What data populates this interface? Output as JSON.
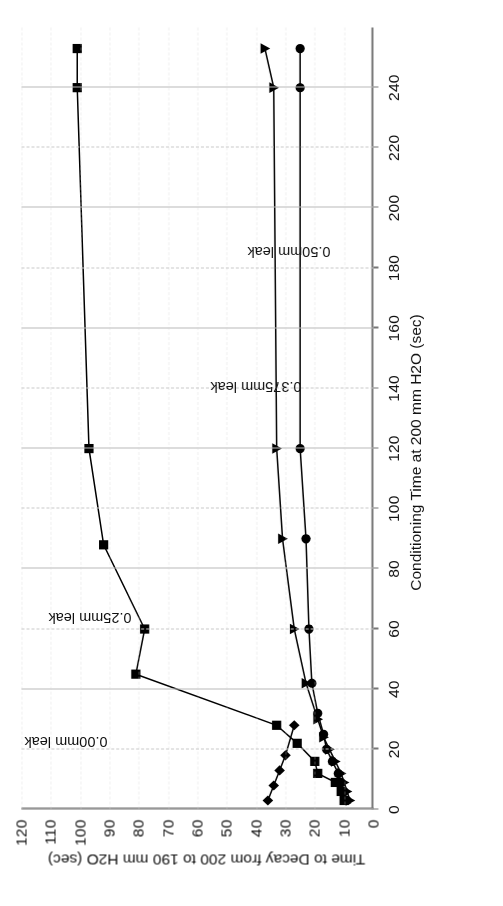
{
  "figure": {
    "orientation_degrees": 180,
    "background": "#ffffff",
    "ink_color": "#000000",
    "grid_color": "#c9c9c9"
  },
  "chart_data": {
    "type": "line",
    "title": "",
    "xlabel": "Conditioning Time at 200 mm H2O (sec)",
    "ylabel": "Time to Decay from 200 to 190 mm H2O (sec)",
    "xlim": [
      0,
      260
    ],
    "ylim": [
      0,
      120
    ],
    "xticks": [
      0,
      20,
      40,
      60,
      80,
      100,
      120,
      140,
      160,
      180,
      200,
      220,
      240
    ],
    "yticks": [
      0,
      10,
      20,
      30,
      40,
      50,
      60,
      70,
      80,
      90,
      100,
      110,
      120
    ],
    "grid": true,
    "legend": "inline-annotations",
    "series": [
      {
        "name": "0.00mm leak",
        "marker": "diamond",
        "label_x": 25,
        "label_y": 96,
        "points": [
          {
            "x": 3,
            "y": 36
          },
          {
            "x": 8,
            "y": 34
          },
          {
            "x": 13,
            "y": 32
          },
          {
            "x": 18,
            "y": 30
          },
          {
            "x": 28,
            "y": 27
          }
        ]
      },
      {
        "name": "0.25mm leak",
        "marker": "square",
        "label_x": 66,
        "label_y": 88,
        "points": [
          {
            "x": 3,
            "y": 10
          },
          {
            "x": 6,
            "y": 11
          },
          {
            "x": 9,
            "y": 13
          },
          {
            "x": 12,
            "y": 19
          },
          {
            "x": 16,
            "y": 20
          },
          {
            "x": 22,
            "y": 26
          },
          {
            "x": 28,
            "y": 33
          },
          {
            "x": 45,
            "y": 81
          },
          {
            "x": 60,
            "y": 78
          },
          {
            "x": 88,
            "y": 92
          },
          {
            "x": 120,
            "y": 97
          },
          {
            "x": 240,
            "y": 101
          },
          {
            "x": 253,
            "y": 101
          }
        ]
      },
      {
        "name": "0.375mm leak",
        "marker": "triangle",
        "label_x": 143,
        "label_y": 30,
        "points": [
          {
            "x": 3,
            "y": 8
          },
          {
            "x": 6,
            "y": 9
          },
          {
            "x": 9,
            "y": 10
          },
          {
            "x": 12,
            "y": 11
          },
          {
            "x": 16,
            "y": 13
          },
          {
            "x": 20,
            "y": 15
          },
          {
            "x": 24,
            "y": 17
          },
          {
            "x": 30,
            "y": 19
          },
          {
            "x": 42,
            "y": 23
          },
          {
            "x": 60,
            "y": 27
          },
          {
            "x": 90,
            "y": 31
          },
          {
            "x": 120,
            "y": 33
          },
          {
            "x": 240,
            "y": 34
          },
          {
            "x": 253,
            "y": 37
          }
        ]
      },
      {
        "name": "0.50mm leak",
        "marker": "circle",
        "label_x": 188,
        "label_y": 20,
        "points": [
          {
            "x": 3,
            "y": 9
          },
          {
            "x": 6,
            "y": 10
          },
          {
            "x": 9,
            "y": 11
          },
          {
            "x": 12,
            "y": 12
          },
          {
            "x": 16,
            "y": 14
          },
          {
            "x": 20,
            "y": 16
          },
          {
            "x": 25,
            "y": 17
          },
          {
            "x": 32,
            "y": 19
          },
          {
            "x": 42,
            "y": 21
          },
          {
            "x": 60,
            "y": 22
          },
          {
            "x": 90,
            "y": 23
          },
          {
            "x": 120,
            "y": 25
          },
          {
            "x": 240,
            "y": 25
          },
          {
            "x": 253,
            "y": 25
          }
        ]
      }
    ]
  }
}
